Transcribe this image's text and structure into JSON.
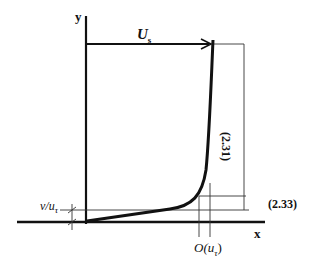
{
  "diagram": {
    "axes": {
      "x_label": "x",
      "y_label": "y"
    },
    "velocity_label": {
      "main": "U",
      "sub": "s"
    },
    "bracket_labels": {
      "outer": "(2.31)",
      "inner": "(2.33)"
    },
    "sublayer_label": {
      "main": "v/u",
      "sub": "τ"
    },
    "order_label": {
      "main": "O(u",
      "sub": "τ",
      "close": ")"
    },
    "colors": {
      "line": "#111111",
      "thin": "#333333",
      "background": "#ffffff"
    }
  }
}
